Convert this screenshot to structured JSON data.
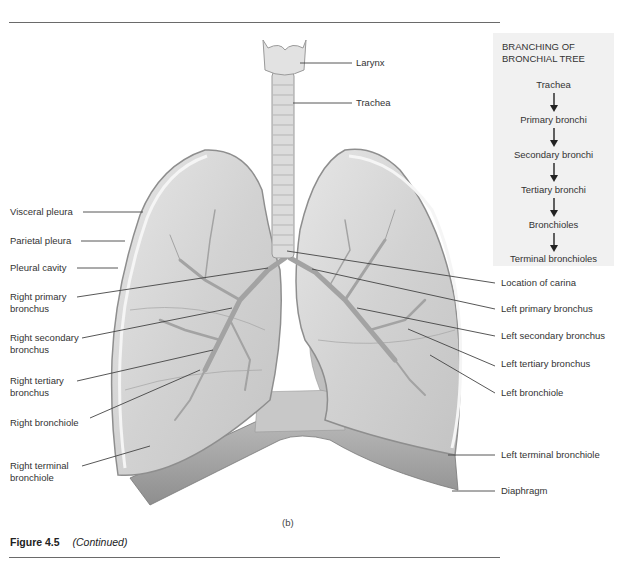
{
  "figure": {
    "caption_number": "Figure 4.5",
    "caption_note": "(Continued)",
    "panel_label": "(b)"
  },
  "sidebox": {
    "title_line1": "BRANCHING OF",
    "title_line2": "BRONCHIAL TREE",
    "steps": [
      "Trachea",
      "Primary bronchi",
      "Secondary bronchi",
      "Tertiary bronchi",
      "Bronchioles",
      "Terminal bronchioles"
    ]
  },
  "labels_left": [
    {
      "text": "Visceral pleura"
    },
    {
      "text": "Parietal pleura"
    },
    {
      "text": "Pleural cavity"
    },
    {
      "line1": "Right primary",
      "line2": "bronchus"
    },
    {
      "line1": "Right secondary",
      "line2": "bronchus"
    },
    {
      "line1": "Right tertiary",
      "line2": "bronchus"
    },
    {
      "text": "Right bronchiole"
    },
    {
      "line1": "Right terminal",
      "line2": "bronchiole"
    }
  ],
  "labels_right": [
    {
      "text": "Larynx"
    },
    {
      "text": "Trachea"
    },
    {
      "text": "Location of carina"
    },
    {
      "text": "Left primary bronchus"
    },
    {
      "text": "Left secondary bronchus"
    },
    {
      "text": "Left tertiary bronchus"
    },
    {
      "text": "Left bronchiole"
    },
    {
      "text": "Left terminal bronchiole"
    },
    {
      "text": "Diaphragm"
    }
  ],
  "colors": {
    "lung_fill": "#d9d9d9",
    "lung_edge": "#9a9a9a",
    "pleura": "#eeeeee",
    "airway": "#a8a8a8",
    "box_bg": "#f1f1f1",
    "text": "#333333"
  }
}
